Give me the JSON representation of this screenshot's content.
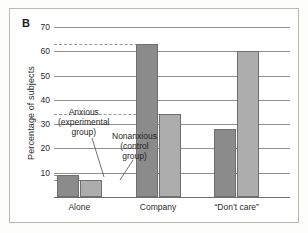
{
  "figure": {
    "panel_letter": "B",
    "ylabel": "Percentage of subjects"
  },
  "annotations": {
    "anxious": "Anxious\n(experimental\ngroup)",
    "anxious_line1": "Anxious",
    "anxious_line2": "(experimental",
    "anxious_line3": "group)",
    "nonanxious_line1": "Nonanxious",
    "nonanxious_line2": "(control",
    "nonanxious_line3": "group)"
  },
  "colors": {
    "anxious": "#8b8b8b",
    "nonanxious": "#adadad",
    "gridline": "#8f8f8f",
    "frame": "#b9b9b4"
  },
  "chart_data": {
    "type": "bar",
    "title": "",
    "xlabel": "",
    "ylabel": "Percentage of subjects",
    "categories": [
      "Alone",
      "Company",
      "“Don’t care”"
    ],
    "series": [
      {
        "name": "Anxious (experimental group)",
        "values": [
          9,
          63,
          28
        ]
      },
      {
        "name": "Nonanxious (control group)",
        "values": [
          7,
          34,
          60
        ]
      }
    ],
    "ylim": [
      0,
      70
    ],
    "yticks": [
      10,
      20,
      30,
      40,
      50,
      60,
      70
    ],
    "ytick_labels": [
      "10",
      "20",
      "30",
      "40",
      "50",
      "60",
      "70"
    ],
    "grid": true,
    "legend": "annotations-with-leader-lines"
  }
}
